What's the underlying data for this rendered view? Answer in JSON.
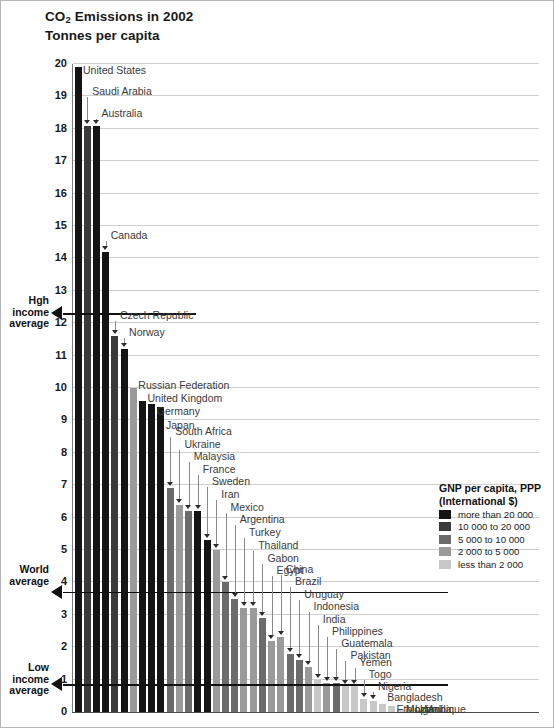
{
  "header": {
    "title_pre": "CO",
    "title_sub": "2",
    "title_post": " Emissions in 2002",
    "subtitle": "Tonnes per capita"
  },
  "annotations": {
    "high_income": {
      "line1": "Hgh",
      "line2": "income",
      "line3": "average",
      "value": 12.3
    },
    "world": {
      "line1": "World",
      "line2": "average",
      "value": 3.7
    },
    "low_income": {
      "line1": "Low",
      "line2": "income",
      "line3": "average",
      "value": 0.85
    }
  },
  "legend": {
    "title_line1": "GNP per capita, PPP",
    "title_line2": "(International $)",
    "items": [
      {
        "label": "more than 20 000",
        "color": "#141414"
      },
      {
        "label": "10 000 to  20 000",
        "color": "#3a3a3a"
      },
      {
        "label": "5 000 to  10 000",
        "color": "#6b6b6b"
      },
      {
        "label": "2 000 to 5 000",
        "color": "#9a9a9a"
      },
      {
        "label": "less than 2 000",
        "color": "#c8c8c8"
      }
    ]
  },
  "chart_data": {
    "type": "bar",
    "title": "CO2 Emissions in 2002",
    "subtitle": "Tonnes per capita",
    "xlabel": "",
    "ylabel": "Tonnes per capita",
    "ylim": [
      0,
      20
    ],
    "yticks": [
      0,
      1,
      2,
      3,
      4,
      5,
      6,
      7,
      8,
      9,
      10,
      11,
      12,
      13,
      14,
      15,
      16,
      17,
      18,
      19,
      20
    ],
    "grid": true,
    "legend_position": "right",
    "categories": [
      "United States",
      "Saudi Arabia",
      "Australia",
      "Canada",
      "Czech Republic",
      "Norway",
      "Russian Federation",
      "United Kingdom",
      "Germany",
      "Japan",
      "South Africa",
      "Ukraine",
      "Malaysia",
      "France",
      "Sweden",
      "Iran",
      "Mexico",
      "Argentina",
      "Turkey",
      "Thailand",
      "Gabon",
      "Egypt",
      "China",
      "Brazil",
      "Uruguay",
      "Indonesia",
      "India",
      "Philippines",
      "Guatemala",
      "Pakistan",
      "Yemen",
      "Togo",
      "Nigeria",
      "Bangladesh",
      "Ethiopia",
      "Mozambique",
      "Uganda",
      "Mali"
    ],
    "values": [
      19.9,
      18.1,
      18.1,
      14.2,
      11.6,
      11.2,
      10.0,
      9.6,
      9.5,
      9.4,
      6.9,
      6.4,
      6.2,
      6.2,
      5.3,
      5.0,
      4.0,
      3.5,
      3.2,
      3.2,
      2.9,
      2.2,
      2.3,
      1.8,
      1.6,
      1.4,
      1.0,
      0.9,
      0.9,
      0.8,
      0.8,
      0.4,
      0.35,
      0.25,
      0.2,
      0.1,
      0.1,
      0.05
    ],
    "colors": [
      "#141414",
      "#3a3a3a",
      "#141414",
      "#141414",
      "#3a3a3a",
      "#141414",
      "#9a9a9a",
      "#141414",
      "#141414",
      "#141414",
      "#6b6b6b",
      "#9a9a9a",
      "#6b6b6b",
      "#141414",
      "#141414",
      "#9a9a9a",
      "#6b6b6b",
      "#6b6b6b",
      "#9a9a9a",
      "#9a9a9a",
      "#6b6b6b",
      "#9a9a9a",
      "#9a9a9a",
      "#6b6b6b",
      "#6b6b6b",
      "#9a9a9a",
      "#c8c8c8",
      "#9a9a9a",
      "#6b6b6b",
      "#c8c8c8",
      "#c8c8c8",
      "#c8c8c8",
      "#c8c8c8",
      "#c8c8c8",
      "#c8c8c8",
      "#c8c8c8",
      "#c8c8c8",
      "#c8c8c8"
    ],
    "label_text_y": [
      63,
      84,
      106,
      228,
      308,
      325,
      378,
      391,
      404,
      418,
      424,
      437,
      449,
      462,
      474,
      487,
      500,
      512,
      525,
      538,
      551,
      563,
      562,
      574,
      587,
      599,
      612,
      624,
      636,
      648,
      655,
      667,
      679,
      690,
      702,
      702,
      702,
      702
    ]
  }
}
